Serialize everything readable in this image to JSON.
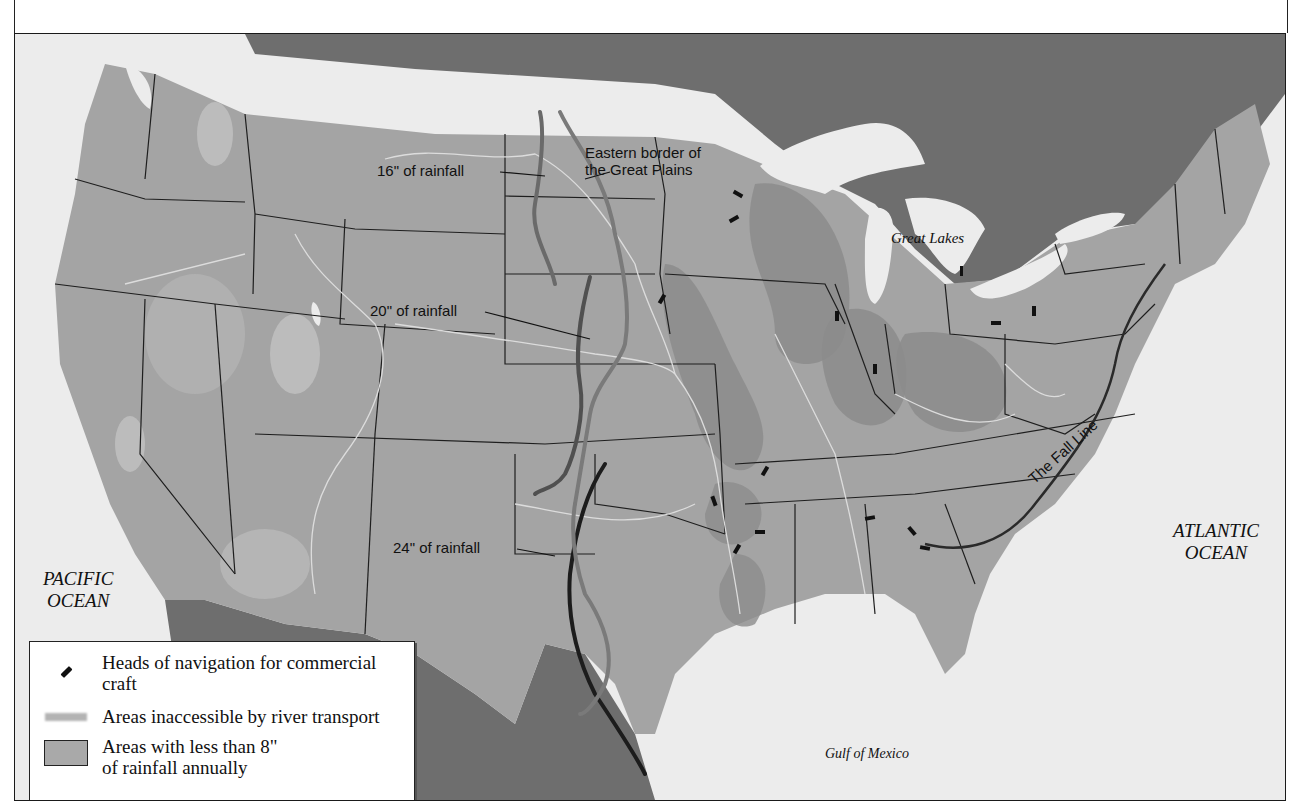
{
  "map": {
    "labels": {
      "great_plains_border": "Eastern border of\nthe Great Plains",
      "great_plains_border_line1": "Eastern border of",
      "great_plains_border_line2": "the Great Plains",
      "rain16": "16\" of rainfall",
      "rain20": "20\" of rainfall",
      "rain24": "24\" of rainfall",
      "great_lakes": "Great Lakes",
      "fall_line": "The Fall Line",
      "pacific_line1": "PACIFIC",
      "pacific_line2": "OCEAN",
      "atlantic_line1": "ATLANTIC",
      "atlantic_line2": "OCEAN",
      "gulf": "Gulf of Mexico"
    },
    "colors": {
      "land_us": "#a4a4a4",
      "land_foreign": "#6e6e6e",
      "water": "#ececec",
      "dry_area": "#b9b9b9",
      "inaccessible": "#8a8a8a",
      "state_border": "#1e1e1e",
      "river": "#dcdcdc",
      "rain_line_16": "#6a6a6a",
      "rain_line_20": "#505050",
      "rain_line_24": "#1c1c1c",
      "plains_border": "#7a7a7a"
    },
    "heads_of_navigation_count": 15
  },
  "legend": {
    "items": [
      {
        "symbol": "heads-of-navigation",
        "label": "Heads of navigation for commercial craft"
      },
      {
        "symbol": "inaccessible-area",
        "label": "Areas inaccessible by river transport"
      },
      {
        "symbol": "dry-area",
        "label": "Areas with less than 8\" of rainfall annually"
      }
    ]
  }
}
